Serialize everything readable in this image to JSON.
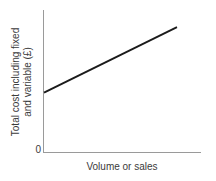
{
  "chart_data": {
    "type": "line",
    "title": "",
    "subtitle": "",
    "xlabel": "Volume or sales",
    "ylabel_line1": "Total cost including fixed",
    "ylabel_line2": "and variable (£)",
    "ylabel": "Total cost including fixed and variable (£)",
    "grid": false,
    "legend": null,
    "xlim": [
      0,
      100
    ],
    "ylim": [
      0,
      100
    ],
    "x_tick_labels": [],
    "y_tick_labels": [
      "0"
    ],
    "origin_label": "0",
    "series": [
      {
        "name": "Total cost",
        "color": "#1b1b1b",
        "x": [
          0,
          100
        ],
        "values": [
          42,
          88
        ],
        "intercept": 42,
        "slope": 0.46
      }
    ],
    "axis_color": "#9a9a9a",
    "background": "#ffffff"
  }
}
